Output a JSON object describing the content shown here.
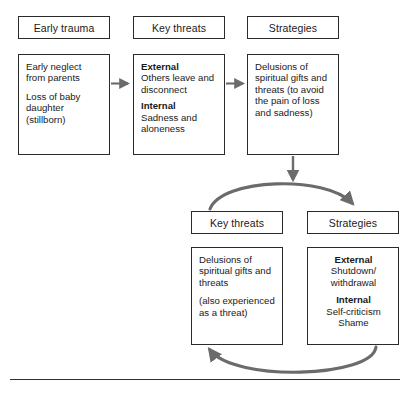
{
  "figure": {
    "line_color": "#2b2b2b",
    "arrow_color": "#6b6b6b",
    "background": "#ffffff"
  },
  "top_row": {
    "columns": [
      {
        "header": "Early trauma",
        "lines": [
          "Early neglect from parents",
          "Loss of baby daughter (stillborn)"
        ]
      },
      {
        "header": "Key threats",
        "sections": [
          {
            "label": "External",
            "text": "Others leave and disconnect"
          },
          {
            "label": "Internal",
            "text": "Sadness and aloneness"
          }
        ]
      },
      {
        "header": "Strategies",
        "lines": [
          "Delusions of spiritual gifts and threats (to avoid the pain of loss and sadness)"
        ]
      }
    ]
  },
  "bottom_row": {
    "columns": [
      {
        "header": "Key threats",
        "lines": [
          "Delusions of spiritual gifts and threats",
          "(also experienced as a threat)"
        ]
      },
      {
        "header": "Strategies",
        "sections": [
          {
            "label": "External",
            "text": "Shutdown/ withdrawal"
          },
          {
            "label": "Internal",
            "text": "Self-criticism Shame"
          }
        ]
      }
    ]
  },
  "connectors": [
    {
      "name": "trauma-to-threats",
      "type": "straight-arrow-right"
    },
    {
      "name": "threats-to-strategies",
      "type": "straight-arrow-right"
    },
    {
      "name": "strategies-down-to-cycle",
      "type": "straight-arrow-down"
    },
    {
      "name": "cycle-top-arc",
      "type": "curved-arrow-right"
    },
    {
      "name": "cycle-bottom-arc",
      "type": "curved-arrow-left"
    }
  ]
}
